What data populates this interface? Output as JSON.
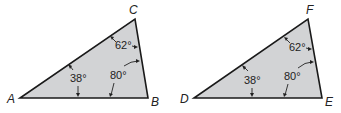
{
  "diagram": {
    "type": "similar-triangles",
    "colors": {
      "fill": "#d2d3d5",
      "stroke": "#1a1a1a",
      "text": "#222222"
    },
    "triangles": [
      {
        "name": "ABC",
        "vertices": {
          "A": "A",
          "B": "B",
          "C": "C"
        },
        "angles": {
          "at_A": "38°",
          "at_B": "80°",
          "at_C": "62°"
        }
      },
      {
        "name": "DEF",
        "vertices": {
          "D": "D",
          "E": "E",
          "F": "F"
        },
        "angles": {
          "at_D": "38°",
          "at_E": "80°",
          "at_F": "62°"
        }
      }
    ]
  }
}
